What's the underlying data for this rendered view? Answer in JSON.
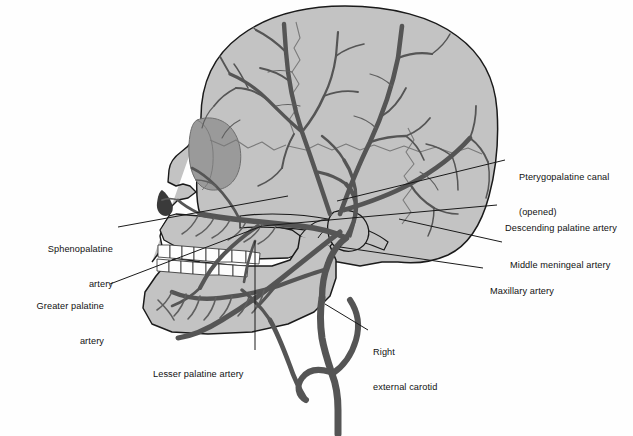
{
  "figure": {
    "type": "anatomical-illustration",
    "palette": {
      "background": "#fefefe",
      "bone_fill": "#c3c3c3",
      "bone_fill_light": "#cccccc",
      "bone_outline": "#1a1a1a",
      "orbit_fill": "#9a9a9a",
      "nasal_shadow": "#3a3a3a",
      "artery": "#555555",
      "artery_thin": "#5f5f5f",
      "suture": "#7a7a7a",
      "tooth_fill": "#fdfdfd",
      "leader_line": "#1a1a1a",
      "label_text": "#111111"
    }
  },
  "labels": [
    {
      "id": "pterygopalatine-canal",
      "name": "pterygopalatine-canal-label",
      "lines": [
        "Pterygopalatine canal",
        "(opened)"
      ],
      "align": "left",
      "text_x": 519,
      "text_y": 154,
      "leader": {
        "x1": 505,
        "y1": 160,
        "x2": 337,
        "y2": 201
      }
    },
    {
      "id": "descending-palatine-artery",
      "name": "descending-palatine-artery-label",
      "lines": [
        "Descending palatine artery"
      ],
      "align": "left",
      "text_x": 505,
      "text_y": 201,
      "leader": {
        "x1": 497,
        "y1": 205,
        "x2": 262,
        "y2": 226
      }
    },
    {
      "id": "middle-meningeal-artery",
      "name": "middle-meningeal-artery-label",
      "lines": [
        "Middle meningeal artery"
      ],
      "align": "left",
      "text_x": 510,
      "text_y": 238,
      "leader": {
        "x1": 502,
        "y1": 242,
        "x2": 399,
        "y2": 219
      }
    },
    {
      "id": "maxillary-artery",
      "name": "maxillary-artery-label",
      "lines": [
        "Maxillary artery"
      ],
      "align": "left",
      "text_x": 490,
      "text_y": 264,
      "leader": {
        "x1": 483,
        "y1": 268,
        "x2": 340,
        "y2": 247
      }
    },
    {
      "id": "sphenopalatine-artery",
      "name": "sphenopalatine-artery-label",
      "lines": [
        "Sphenopalatine",
        "artery"
      ],
      "align": "right",
      "text_x": 38,
      "text_y": 222,
      "text_w": 75,
      "leader": {
        "x1": 118,
        "y1": 227,
        "x2": 288,
        "y2": 196
      }
    },
    {
      "id": "greater-palatine-artery",
      "name": "greater-palatine-artery-label",
      "lines": [
        "Greater palatine",
        "artery"
      ],
      "align": "right",
      "text_x": 12,
      "text_y": 279,
      "text_w": 92,
      "leader": {
        "x1": 110,
        "y1": 284,
        "x2": 262,
        "y2": 226
      }
    },
    {
      "id": "lesser-palatine-artery",
      "name": "lesser-palatine-artery-label",
      "lines": [
        "Lesser palatine artery"
      ],
      "align": "left",
      "text_x": 153,
      "text_y": 347,
      "leader": {
        "x1": 255,
        "y1": 350,
        "x2": 255,
        "y2": 241
      }
    },
    {
      "id": "right-external-carotid",
      "name": "right-external-carotid-label",
      "lines": [
        "Right",
        "external carotid"
      ],
      "align": "left",
      "text_x": 373,
      "text_y": 325,
      "leader": {
        "x1": 368,
        "y1": 330,
        "x2": 325,
        "y2": 304
      }
    }
  ]
}
